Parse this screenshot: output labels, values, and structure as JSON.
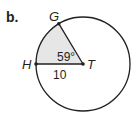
{
  "problem_label": "b.",
  "points": {
    "G": "G",
    "H": "H",
    "T": "T"
  },
  "angle_label": "59°",
  "radius_label": "10",
  "colors": {
    "stroke": "#231f20",
    "sector_fill": "#e6e6e6"
  }
}
